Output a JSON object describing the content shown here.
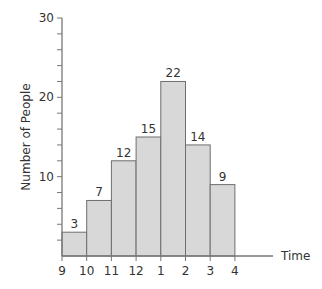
{
  "chart_data": {
    "type": "bar",
    "subtype": "histogram",
    "title": "",
    "xlabel": "Time",
    "ylabel": "Number of People",
    "x_tick_labels": [
      "9",
      "10",
      "11",
      "12",
      "1",
      "2",
      "3",
      "4"
    ],
    "categories": [
      "9-10",
      "10-11",
      "11-12",
      "12-1",
      "1-2",
      "2-3",
      "3-4"
    ],
    "values": [
      3,
      7,
      12,
      15,
      22,
      14,
      9
    ],
    "data_labels": [
      "3",
      "7",
      "12",
      "15",
      "22",
      "14",
      "9"
    ],
    "y_tick_labels": [
      "10",
      "20",
      "30"
    ],
    "ylim": [
      0,
      30
    ],
    "y_major_step": 10,
    "y_minor_step": 2,
    "grid": false,
    "legend": null,
    "colors": {
      "bar_fill": "#d8d8d8",
      "bar_stroke": "#6e6e6e",
      "axis": "#777777",
      "text": "#333333"
    }
  }
}
